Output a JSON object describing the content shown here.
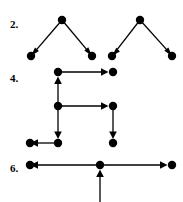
{
  "page": {
    "width": 183,
    "height": 202,
    "background": "#ffffff",
    "ink_color": "#000000"
  },
  "problems": [
    {
      "id": "problem-2",
      "label": "2.",
      "label_x": 10,
      "label_y": 28,
      "description": "Two separate inverted-V (lambda) shaped directed graphs; each has an apex vertex with two arrows pointing down-left and down-right to leaf vertices.",
      "vertices": [
        {
          "name": "p2-g1-apex",
          "x": 62,
          "y": 20
        },
        {
          "name": "p2-g1-leaf-left",
          "x": 31,
          "y": 56
        },
        {
          "name": "p2-g1-leaf-right",
          "x": 92,
          "y": 56
        },
        {
          "name": "p2-g2-apex",
          "x": 140,
          "y": 20
        },
        {
          "name": "p2-g2-leaf-left",
          "x": 112,
          "y": 56
        },
        {
          "name": "p2-g2-leaf-right",
          "x": 172,
          "y": 56
        }
      ],
      "edges": [
        {
          "name": "p2-edge-g1-left",
          "from": "p2-g1-apex",
          "to": "p2-g1-leaf-left",
          "x1": 62,
          "y1": 20,
          "x2": 31,
          "y2": 56,
          "arrow": "to"
        },
        {
          "name": "p2-edge-g1-right",
          "from": "p2-g1-apex",
          "to": "p2-g1-leaf-right",
          "x1": 62,
          "y1": 20,
          "x2": 92,
          "y2": 56,
          "arrow": "to"
        },
        {
          "name": "p2-edge-g2-left",
          "from": "p2-g2-apex",
          "to": "p2-g2-leaf-left",
          "x1": 140,
          "y1": 20,
          "x2": 112,
          "y2": 56,
          "arrow": "to"
        },
        {
          "name": "p2-edge-g2-right",
          "from": "p2-g2-apex",
          "to": "p2-g2-leaf-right",
          "x1": 140,
          "y1": 20,
          "x2": 172,
          "y2": 56,
          "arrow": "to"
        }
      ]
    },
    {
      "id": "problem-4",
      "label": "4.",
      "label_x": 10,
      "label_y": 82,
      "description": "Orthogonal staircase directed graph with seven vertices connected by horizontal and vertical arrows.",
      "vertices": [
        {
          "name": "p4-top-left",
          "x": 58,
          "y": 72
        },
        {
          "name": "p4-top-right",
          "x": 113,
          "y": 72
        },
        {
          "name": "p4-middle-left",
          "x": 58,
          "y": 106
        },
        {
          "name": "p4-middle-right",
          "x": 113,
          "y": 106
        },
        {
          "name": "p4-bottom-far-left",
          "x": 30,
          "y": 143
        },
        {
          "name": "p4-bottom-left",
          "x": 58,
          "y": 143
        },
        {
          "name": "p4-bottom-right",
          "x": 113,
          "y": 143
        }
      ],
      "edges": [
        {
          "name": "p4-edge-top-right",
          "from": "p4-top-left",
          "to": "p4-top-right",
          "x1": 58,
          "y1": 72,
          "x2": 113,
          "y2": 72,
          "arrow": "to"
        },
        {
          "name": "p4-edge-middle-up",
          "from": "p4-middle-left",
          "to": "p4-top-left",
          "x1": 58,
          "y1": 106,
          "x2": 58,
          "y2": 72,
          "arrow": "to"
        },
        {
          "name": "p4-edge-middle-right",
          "from": "p4-middle-left",
          "to": "p4-middle-right",
          "x1": 58,
          "y1": 106,
          "x2": 113,
          "y2": 106,
          "arrow": "to"
        },
        {
          "name": "p4-edge-middle-down",
          "from": "p4-middle-left",
          "to": "p4-bottom-left",
          "x1": 58,
          "y1": 106,
          "x2": 58,
          "y2": 143,
          "arrow": "to"
        },
        {
          "name": "p4-edge-bottom-left",
          "from": "p4-bottom-left",
          "to": "p4-bottom-far-left",
          "x1": 58,
          "y1": 143,
          "x2": 30,
          "y2": 143,
          "arrow": "to"
        },
        {
          "name": "p4-edge-right-down",
          "from": "p4-middle-right",
          "to": "p4-bottom-right",
          "x1": 113,
          "y1": 106,
          "x2": 113,
          "y2": 143,
          "arrow": "to"
        }
      ]
    },
    {
      "id": "problem-6",
      "label": "6.",
      "label_x": 10,
      "label_y": 172,
      "description": "Horizontal directed graph: a centre vertex sends arrows left and right to two vertices, and receives an upward arrow from below the visible area.",
      "vertices": [
        {
          "name": "p6-left",
          "x": 30,
          "y": 165
        },
        {
          "name": "p6-center",
          "x": 100,
          "y": 165
        },
        {
          "name": "p6-right",
          "x": 172,
          "y": 165
        }
      ],
      "edges": [
        {
          "name": "p6-edge-left",
          "from": "p6-center",
          "to": "p6-left",
          "x1": 100,
          "y1": 165,
          "x2": 30,
          "y2": 165,
          "arrow": "to"
        },
        {
          "name": "p6-edge-right",
          "from": "p6-center",
          "to": "p6-right",
          "x1": 100,
          "y1": 165,
          "x2": 172,
          "y2": 165,
          "arrow": "to"
        },
        {
          "name": "p6-edge-up",
          "from": "p6-below-offscreen",
          "to": "p6-center",
          "x1": 100,
          "y1": 202,
          "x2": 100,
          "y2": 165,
          "arrow": "to"
        }
      ]
    }
  ],
  "style": {
    "vertex_radius": 4.2,
    "edge_width": 1.3,
    "arrow_size": 6
  }
}
